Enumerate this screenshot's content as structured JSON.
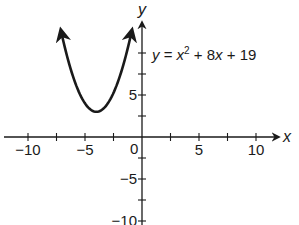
{
  "chart_data": {
    "type": "line",
    "title": "",
    "equation": "y = x^2 + 8x + 19",
    "equation_parts": {
      "lhs": "y",
      "eq": " = ",
      "x": "x",
      "exp": "2",
      "rest": " + 8",
      "x2": "x",
      "tail": " + 19"
    },
    "xlabel": "x",
    "ylabel": "y",
    "xlim": [
      -12,
      13
    ],
    "ylim": [
      -10,
      13
    ],
    "x_ticks": [
      -10,
      -7.5,
      -5,
      -2.5,
      2.5,
      5,
      7.5,
      10
    ],
    "x_tick_labels": [
      {
        "value": -10,
        "label": "−10"
      },
      {
        "value": -5,
        "label": "−5"
      },
      {
        "value": 5,
        "label": "5"
      },
      {
        "value": 10,
        "label": "10"
      }
    ],
    "y_ticks": [
      -7.5,
      -5,
      -2.5,
      2.5,
      5,
      7.5,
      10
    ],
    "y_tick_labels": [
      {
        "value": 5,
        "label": "5"
      },
      {
        "value": -5,
        "label": "−5"
      },
      {
        "value": -10,
        "label": "−10"
      }
    ],
    "origin_label": "0",
    "grid": false,
    "series": [
      {
        "name": "y = x^2 + 8x + 19",
        "vertex": [
          -4,
          3
        ],
        "x": [
          -7.1,
          -7,
          -6.5,
          -6,
          -5.5,
          -5,
          -4.5,
          -4,
          -3.5,
          -3,
          -2.5,
          -2,
          -1.5,
          -1,
          -0.9
        ],
        "values": [
          12.61,
          12,
          9.25,
          7,
          5.25,
          4,
          3.25,
          3,
          3.25,
          4,
          5.25,
          7,
          9.25,
          12,
          12.61
        ],
        "arrows_both_ends": true
      }
    ]
  }
}
